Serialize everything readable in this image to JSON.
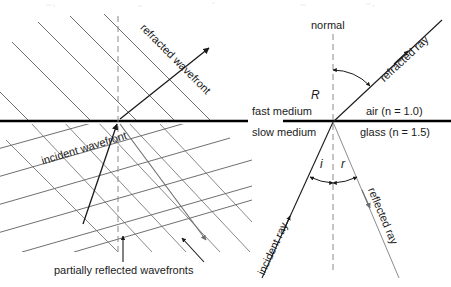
{
  "figure": {
    "type": "physics-optics-diagram",
    "topic": "refraction and reflection at a boundary",
    "interface": {
      "upper_label": "fast medium",
      "lower_label": "slow medium",
      "upper_medium": "air (n = 1.0)",
      "lower_medium": "glass (n = 1.5)",
      "upper_index": 1.0,
      "lower_index": 1.5
    },
    "wave_panel": {
      "incident_wavefront_label": "incident wavefront",
      "refracted_wavefront_label": "refracted wavefront",
      "partial_label": "partially reflected wavefronts"
    },
    "ray_panel": {
      "normal_label": "normal",
      "incident_ray_label": "incident ray",
      "reflected_ray_label": "reflected ray",
      "refracted_ray_label": "refracted ray",
      "angle_incidence": "i",
      "angle_reflection": "r",
      "angle_refraction": "R"
    },
    "colors": {
      "ink": "#1a1a1a",
      "interface": "#000000",
      "wave_line": "#555555",
      "faint_line": "#9a9a9a",
      "background": "#ffffff"
    }
  }
}
